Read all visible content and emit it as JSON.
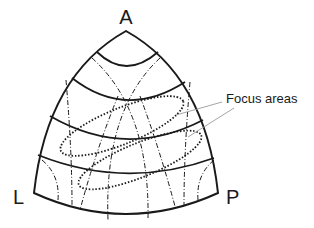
{
  "diagram": {
    "type": "curved triangular (spherical) projection with bands and focus ellipses",
    "vertices": {
      "top": "A",
      "bottom_left": "L",
      "bottom_right": "P"
    },
    "callout": {
      "label": "Focus areas",
      "count": 2
    },
    "colors": {
      "ink": "#1a1a1a",
      "leader": "#9a9a9a",
      "background": "#ffffff"
    },
    "elements": {
      "solid_bands": 4,
      "dashed_meridians": 6,
      "dotted_ellipses": 2
    }
  }
}
